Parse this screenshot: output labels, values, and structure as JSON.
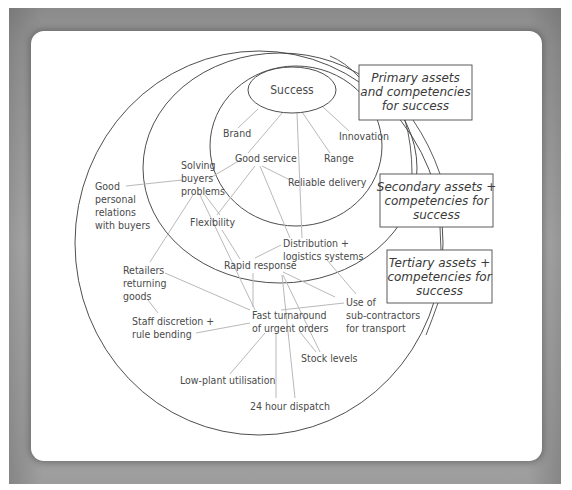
{
  "diagram": {
    "center": {
      "label": "Success"
    },
    "rings": [
      {
        "id": "primary",
        "name": "Primary assets and competencies for success"
      },
      {
        "id": "secondary",
        "name": "Secondary assets + competencies for success"
      },
      {
        "id": "tertiary",
        "name": "Tertiary assets + competencies for success"
      }
    ],
    "legend_boxes": [
      {
        "id": "primary",
        "lines": [
          "Primary assets",
          "and competencies",
          "for success"
        ]
      },
      {
        "id": "secondary",
        "lines": [
          "Secondary assets +",
          "competencies for",
          "success"
        ]
      },
      {
        "id": "tertiary",
        "lines": [
          "Tertiary assets +",
          "competencies for",
          "success"
        ]
      }
    ],
    "nodes": [
      {
        "id": "brand",
        "ring": "primary",
        "lines": [
          "Brand"
        ]
      },
      {
        "id": "innovation",
        "ring": "primary",
        "lines": [
          "Innovation"
        ]
      },
      {
        "id": "good_service",
        "ring": "primary",
        "lines": [
          "Good service"
        ]
      },
      {
        "id": "range",
        "ring": "primary",
        "lines": [
          "Range"
        ]
      },
      {
        "id": "reliable_delivery",
        "ring": "primary",
        "lines": [
          "Reliable delivery"
        ]
      },
      {
        "id": "solving_buyers_problems",
        "ring": "secondary",
        "lines": [
          "Solving",
          "buyers",
          "problems"
        ]
      },
      {
        "id": "flexibility",
        "ring": "secondary",
        "lines": [
          "Flexibility"
        ]
      },
      {
        "id": "distribution_logistics",
        "ring": "secondary",
        "lines": [
          "Distribution +",
          "logistics systems"
        ]
      },
      {
        "id": "rapid_response",
        "ring": "secondary",
        "lines": [
          "Rapid response"
        ]
      },
      {
        "id": "good_personal_relations",
        "ring": "tertiary",
        "lines": [
          "Good",
          "personal",
          "relations",
          "with buyers"
        ]
      },
      {
        "id": "retailers_returning_goods",
        "ring": "tertiary",
        "lines": [
          "Retailers",
          "returning",
          "goods"
        ]
      },
      {
        "id": "use_of_subcontractors",
        "ring": "tertiary",
        "lines": [
          "Use of",
          "sub-contractors",
          "for transport"
        ]
      },
      {
        "id": "fast_turnaround",
        "ring": "tertiary",
        "lines": [
          "Fast turnaround",
          "of urgent orders"
        ]
      },
      {
        "id": "staff_discretion",
        "ring": "tertiary",
        "lines": [
          "Staff discretion +",
          "rule bending"
        ]
      },
      {
        "id": "stock_levels",
        "ring": "tertiary",
        "lines": [
          "Stock levels"
        ]
      },
      {
        "id": "low_plant_utilisation",
        "ring": "tertiary",
        "lines": [
          "Low-plant utilisation"
        ]
      },
      {
        "id": "24_hour_dispatch",
        "ring": "tertiary",
        "lines": [
          "24 hour dispatch"
        ]
      }
    ],
    "edges": [
      [
        "success",
        "brand"
      ],
      [
        "success",
        "innovation"
      ],
      [
        "success",
        "good_service"
      ],
      [
        "success",
        "range"
      ],
      [
        "success",
        "distribution_logistics"
      ],
      [
        "good_service",
        "solving_buyers_problems"
      ],
      [
        "good_service",
        "flexibility"
      ],
      [
        "good_service",
        "reliable_delivery"
      ],
      [
        "good_service",
        "distribution_logistics"
      ],
      [
        "solving_buyers_problems",
        "good_personal_relations"
      ],
      [
        "solving_buyers_problems",
        "flexibility"
      ],
      [
        "solving_buyers_problems",
        "retailers_returning_goods"
      ],
      [
        "solving_buyers_problems",
        "fast_turnaround"
      ],
      [
        "flexibility",
        "rapid_response"
      ],
      [
        "distribution_logistics",
        "rapid_response"
      ],
      [
        "distribution_logistics",
        "use_of_subcontractors"
      ],
      [
        "rapid_response",
        "fast_turnaround"
      ],
      [
        "rapid_response",
        "use_of_subcontractors"
      ],
      [
        "rapid_response",
        "stock_levels"
      ],
      [
        "rapid_response",
        "24_hour_dispatch"
      ],
      [
        "retailers_returning_goods",
        "fast_turnaround"
      ],
      [
        "retailers_returning_goods",
        "staff_discretion"
      ],
      [
        "staff_discretion",
        "fast_turnaround"
      ],
      [
        "use_of_subcontractors",
        "fast_turnaround"
      ],
      [
        "fast_turnaround",
        "stock_levels"
      ],
      [
        "fast_turnaround",
        "low_plant_utilisation"
      ],
      [
        "fast_turnaround",
        "24_hour_dispatch"
      ]
    ]
  }
}
